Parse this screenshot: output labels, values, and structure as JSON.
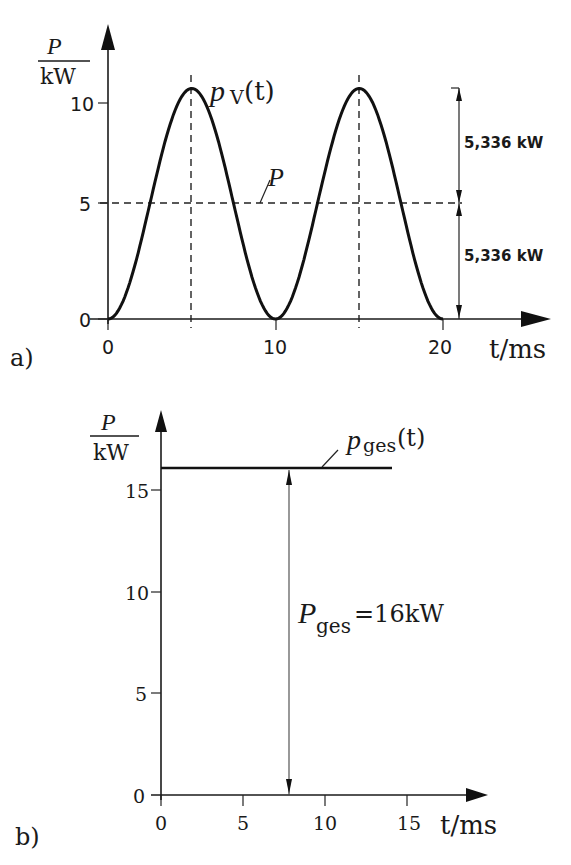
{
  "chart_data": [
    {
      "panel": "a)",
      "type": "line",
      "ylabel_num": "P",
      "ylabel_den": "kW",
      "xlabel": "t/ms",
      "curve_label": "pV(t)",
      "curve_label_main": "p",
      "curve_label_sub": "V",
      "curve_label_arg": "(t)",
      "mean_label": "P",
      "xticks": [
        "0",
        "10",
        "20"
      ],
      "yticks": [
        "0",
        "5",
        "10"
      ],
      "xlim": [
        0,
        20
      ],
      "ylim": [
        0,
        10.672
      ],
      "series": [
        {
          "name": "pV(t)",
          "formula": "10.672 * sin^2(pi * t / 10)",
          "x": [
            0,
            2.5,
            5,
            7.5,
            10,
            12.5,
            15,
            17.5,
            20
          ],
          "values": [
            0,
            5.336,
            10.672,
            5.336,
            0,
            5.336,
            10.672,
            5.336,
            0
          ]
        },
        {
          "name": "P",
          "x": [
            0,
            21
          ],
          "values": [
            5.336,
            5.336
          ]
        }
      ],
      "annotations": [
        "5,336 kW",
        "5,336 kW"
      ],
      "grid": false
    },
    {
      "panel": "b)",
      "type": "line",
      "ylabel_num": "P",
      "ylabel_den": "kW",
      "xlabel": "t/ms",
      "curve_label": "pges(t)",
      "curve_label_main": "p",
      "curve_label_sub": "ges",
      "curve_label_arg": "(t)",
      "xticks": [
        "0",
        "5",
        "10",
        "15"
      ],
      "yticks": [
        "0",
        "5",
        "10",
        "15"
      ],
      "xlim": [
        0,
        15
      ],
      "ylim": [
        0,
        16
      ],
      "series": [
        {
          "name": "pges(t)",
          "x": [
            0,
            14.1
          ],
          "values": [
            16,
            16
          ]
        }
      ],
      "annotation_main": "P",
      "annotation_sub": "ges",
      "annotation_value": "=16kW",
      "grid": false
    }
  ]
}
